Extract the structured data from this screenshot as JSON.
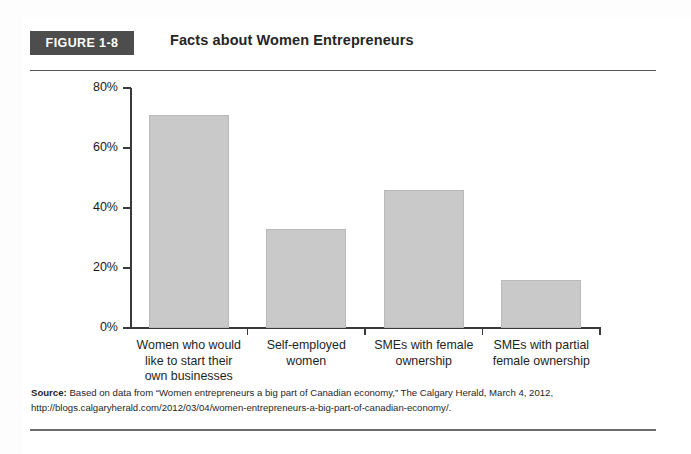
{
  "figure": {
    "badge": "FIGURE 1-8",
    "title": "Facts about Women Entrepreneurs"
  },
  "source": {
    "label": "Source:",
    "text": " Based on data from “Women entrepreneurs a big part of Canadian economy,” The Calgary Herald, March 4, 2012, http://blogs.calgaryherald.com/2012/03/04/women-entrepreneurs-a-big-part-of-canadian-economy/."
  },
  "colors": {
    "bar_fill": "#c9c9c9",
    "bar_border": "#b9b9b9",
    "badge_bg": "#4d4d4d",
    "axis": "#3a3a3a",
    "rule": "#555555"
  },
  "chart_data": {
    "type": "bar",
    "title": "Facts about Women Entrepreneurs",
    "xlabel": "",
    "ylabel": "",
    "ylim": [
      0,
      80
    ],
    "yticks": [
      0,
      20,
      40,
      60,
      80
    ],
    "ytick_labels": [
      "0%",
      "20%",
      "40%",
      "60%",
      "80%"
    ],
    "grid": false,
    "legend": "none",
    "categories": [
      "Women who would like to start their own businesses",
      "Self-employed women",
      "SMEs with female ownership",
      "SMEs with partial female ownership"
    ],
    "category_lines": [
      [
        "Women who would",
        "like to start their",
        "own businesses"
      ],
      [
        "Self-employed",
        "women"
      ],
      [
        "SMEs with female",
        "ownership"
      ],
      [
        "SMEs with partial",
        "female ownership"
      ]
    ],
    "values": [
      71,
      33,
      46,
      16
    ],
    "value_labels": [
      "71%",
      "33%",
      "46%",
      "16%"
    ],
    "units": "percent"
  }
}
